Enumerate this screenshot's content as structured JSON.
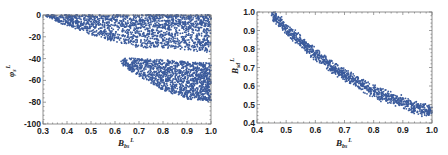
{
  "chart_data": [
    {
      "type": "scatter",
      "title": "",
      "xlabel": "B_{bs}^L",
      "ylabel": "φ_s^L",
      "xlabel_main": "B",
      "xlabel_sub": "bs",
      "xlabel_sup": "L",
      "ylabel_main": "φ",
      "ylabel_sub": "s",
      "ylabel_sup": "L",
      "xlim": [
        0.3,
        1.0
      ],
      "ylim": [
        -100,
        0
      ],
      "xticks": [
        0.3,
        0.4,
        0.5,
        0.6,
        0.7,
        0.8,
        0.9,
        1.0
      ],
      "xtick_labels": [
        "0.3",
        "0.4",
        "0.5",
        "0.6",
        "0.7",
        "0.8",
        "0.9",
        "1.0"
      ],
      "yticks": [
        0,
        -20,
        -40,
        -60,
        -80,
        -100
      ],
      "ytick_labels": [
        "0",
        "-20",
        "-40",
        "-60",
        "-80",
        "-100"
      ],
      "grid": false,
      "legend": null,
      "color": "#3b5b9c",
      "description": "Dense points filling a wedge from (0.3, 0) widening to bottom near -25 at 0.6; upper band spans 0 to about -30 for x≥0.6; a second band centered near -55 spans roughly -45 to -83 for x from 0.65 to 1.0.",
      "regions": [
        {
          "name": "upper-wedge",
          "x_range": [
            0.31,
            1.0
          ],
          "y_top": 0,
          "y_bottom_at_x": [
            [
              0.31,
              -2
            ],
            [
              0.4,
              -10
            ],
            [
              0.5,
              -18
            ],
            [
              0.6,
              -25
            ],
            [
              0.7,
              -30
            ],
            [
              0.8,
              -30
            ],
            [
              0.9,
              -32
            ],
            [
              1.0,
              -35
            ]
          ],
          "n": 1700
        },
        {
          "name": "lower-band",
          "x_range": [
            0.62,
            1.0
          ],
          "y_center_at_x": [
            [
              0.62,
              -42
            ],
            [
              0.7,
              -48
            ],
            [
              0.8,
              -55
            ],
            [
              0.9,
              -60
            ],
            [
              1.0,
              -62
            ]
          ],
          "y_half_width_at_x": [
            [
              0.62,
              3
            ],
            [
              0.7,
              8
            ],
            [
              0.8,
              14
            ],
            [
              0.9,
              17
            ],
            [
              1.0,
              18
            ]
          ],
          "n": 1300
        }
      ]
    },
    {
      "type": "scatter",
      "title": "",
      "xlabel": "B_{bs}^L",
      "ylabel": "B_{sd}^L",
      "xlabel_main": "B",
      "xlabel_sub": "bs",
      "xlabel_sup": "L",
      "ylabel_main": "B",
      "ylabel_sub": "sd",
      "ylabel_sup": "L",
      "xlim": [
        0.4,
        1.0
      ],
      "ylim": [
        0.4,
        1.0
      ],
      "xticks": [
        0.4,
        0.5,
        0.6,
        0.7,
        0.8,
        0.9,
        1.0
      ],
      "xtick_labels": [
        "0.4",
        "0.5",
        "0.6",
        "0.7",
        "0.8",
        "0.9",
        "1.0"
      ],
      "yticks": [
        1.0,
        0.9,
        0.8,
        0.7,
        0.6,
        0.5,
        0.4
      ],
      "ytick_labels": [
        "1.0",
        "0.9",
        "0.8",
        "0.7",
        "0.6",
        "0.5",
        "0.4"
      ],
      "grid": false,
      "legend": null,
      "color": "#3b5b9c",
      "description": "Narrow curved band following roughly B_sd ≈ 0.45/B_bs, from (0.45, 1.0) down to (1.0, 0.46).",
      "curve_points": [
        [
          0.45,
          0.99
        ],
        [
          0.5,
          0.91
        ],
        [
          0.55,
          0.84
        ],
        [
          0.6,
          0.77
        ],
        [
          0.65,
          0.71
        ],
        [
          0.7,
          0.66
        ],
        [
          0.75,
          0.62
        ],
        [
          0.8,
          0.57
        ],
        [
          0.85,
          0.54
        ],
        [
          0.9,
          0.51
        ],
        [
          0.95,
          0.48
        ],
        [
          1.0,
          0.46
        ]
      ],
      "band_half_width": 0.025,
      "n": 1100
    }
  ]
}
